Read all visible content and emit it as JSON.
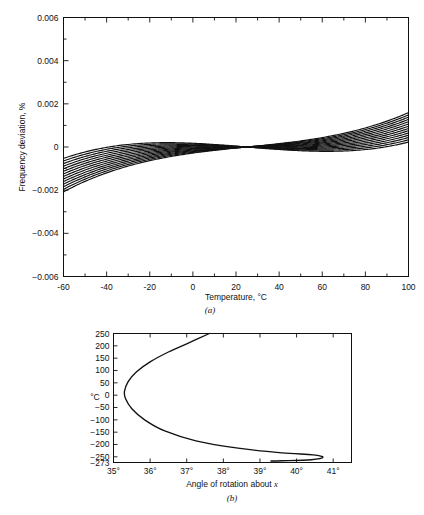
{
  "figure": {
    "panels": [
      {
        "id": "a",
        "caption": "(a)",
        "xlabel": "Temperature, °C",
        "ylabel": "Frequency deviation, %",
        "x_ticks": [
          "-60",
          "-40",
          "-20",
          "0",
          "20",
          "40",
          "60",
          "80",
          "100"
        ],
        "y_ticks": [
          "0.006",
          "0.004",
          "0.002",
          "0",
          "-0.002",
          "-0.004",
          "-0.006"
        ]
      },
      {
        "id": "b",
        "caption": "(b)",
        "xlabel_pre": "Angle of rotation about ",
        "xlabel_italic": "x",
        "ylabel": "°C",
        "x_ticks": [
          "35°",
          "36°",
          "37°",
          "38°",
          "39°",
          "40°",
          "41°"
        ],
        "y_ticks": [
          "250",
          "200",
          "150",
          "100",
          "50",
          "0",
          "-50",
          "-100",
          "-150",
          "-200",
          "-250",
          "-273"
        ]
      }
    ]
  },
  "chart_data": [
    {
      "type": "line",
      "panel": "a",
      "title": "",
      "xlabel": "Temperature, °C",
      "ylabel": "Frequency deviation, %",
      "xlim": [
        -60,
        100
      ],
      "ylim": [
        -0.006,
        0.006
      ],
      "xticks": [
        -60,
        -40,
        -20,
        0,
        20,
        40,
        60,
        80,
        100
      ],
      "yticks": [
        0.006,
        0.004,
        0.002,
        0,
        -0.002,
        -0.004,
        -0.006
      ],
      "minor_xticks": [
        -50,
        -30,
        -10,
        10,
        30,
        50,
        70,
        90
      ],
      "minor_yticks": [
        0.005,
        0.003,
        0.001,
        -0.001,
        -0.003,
        -0.005
      ],
      "grid": false,
      "legend": "none",
      "note": "Family of cubic frequency-deviation curves for AT-cut quartz crystals at a range of cut angles; all curves pass through an inflection point near 25 °C, 0 %.",
      "inflection_point": {
        "x": 25,
        "y": 0
      },
      "series": [
        {
          "name": "curve-1",
          "cubic_slope": 1.0,
          "x": [
            -60,
            -40,
            -20,
            0,
            20,
            25,
            30,
            50,
            70,
            90,
            100
          ],
          "values": [
            -0.00535,
            -0.00252,
            -0.00069,
            0.0,
            0.00016,
            0.0,
            -0.0002,
            -0.001,
            -0.00106,
            0.00084,
            0.0029
          ]
        },
        {
          "name": "curve-2",
          "cubic_slope": 0.86,
          "x": [
            -60,
            -40,
            -20,
            0,
            20,
            25,
            30,
            50,
            70,
            90,
            100
          ],
          "values": [
            -0.00452,
            -0.0019,
            -0.00038,
            0.00014,
            0.00015,
            0.0,
            -0.00016,
            -0.00073,
            -0.00058,
            0.0015,
            0.0036
          ]
        },
        {
          "name": "curve-3",
          "cubic_slope": 0.72,
          "x": [
            -60,
            -40,
            -20,
            0,
            20,
            25,
            30,
            50,
            70,
            90,
            100
          ],
          "values": [
            -0.0037,
            -0.00128,
            -7e-05,
            0.00028,
            0.00013,
            0.0,
            -0.00012,
            -0.00046,
            -0.0001,
            0.00216,
            0.0043
          ]
        },
        {
          "name": "curve-4",
          "cubic_slope": 0.58,
          "x": [
            -60,
            -40,
            -20,
            0,
            20,
            25,
            30,
            50,
            70,
            90,
            100
          ],
          "values": [
            -0.00288,
            -0.00066,
            0.00024,
            0.00042,
            0.00011,
            0.0,
            -8e-05,
            -0.00019,
            0.00038,
            0.00282,
            0.005
          ]
        },
        {
          "name": "curve-5",
          "cubic_slope": 0.44,
          "x": [
            -60,
            -40,
            -20,
            0,
            20,
            25,
            30,
            50,
            70,
            90,
            100
          ],
          "values": [
            -0.00205,
            -4e-05,
            0.00055,
            0.00056,
            0.0001,
            0.0,
            -4e-05,
            8e-05,
            0.00086,
            0.00348,
            0.0057
          ]
        },
        {
          "name": "curve-6",
          "cubic_slope": 0.3,
          "x": [
            -60,
            -40,
            -20,
            0,
            20,
            25,
            30,
            50,
            70,
            90,
            100
          ],
          "values": [
            -0.00123,
            0.00058,
            0.00086,
            0.0007,
            8e-05,
            0.0,
            0.0,
            0.00035,
            0.00134,
            0.00414,
            0.006
          ]
        },
        {
          "name": "curve-7",
          "cubic_slope": 0.16,
          "x": [
            -60,
            -40,
            -20,
            0,
            20,
            25,
            30,
            50,
            70,
            90,
            100
          ],
          "values": [
            -0.00041,
            0.0012,
            0.00117,
            0.00084,
            7e-05,
            0.0,
            4e-05,
            0.00062,
            0.00182,
            0.0048,
            0.006
          ]
        },
        {
          "name": "curve-8",
          "cubic_slope": 0.02,
          "x": [
            -60,
            -40,
            -20,
            0,
            20,
            25,
            30,
            50,
            70,
            90,
            100
          ],
          "values": [
            0.00042,
            0.00182,
            0.00148,
            0.00098,
            5e-05,
            0.0,
            8e-05,
            0.00089,
            0.0023,
            0.00546,
            0.006
          ]
        },
        {
          "name": "curve-9",
          "cubic_slope": -0.12,
          "x": [
            -60,
            -40,
            -20,
            0,
            20,
            25,
            30,
            50,
            70,
            90,
            100
          ],
          "values": [
            0.00124,
            0.00244,
            0.00179,
            0.00112,
            4e-05,
            0.0,
            0.00012,
            0.00116,
            0.00278,
            0.006,
            0.006
          ]
        },
        {
          "name": "curve-10",
          "cubic_slope": -0.26,
          "x": [
            -60,
            -40,
            -20,
            0,
            20,
            25,
            30,
            50,
            70,
            90,
            100
          ],
          "values": [
            0.00207,
            0.00306,
            0.0021,
            0.00126,
            2e-05,
            0.0,
            0.00016,
            0.00143,
            0.00326,
            0.006,
            0.006
          ]
        },
        {
          "name": "curve-11",
          "cubic_slope": -0.4,
          "x": [
            -60,
            -40,
            -20,
            0,
            20,
            25,
            30,
            50,
            70,
            90,
            100
          ],
          "values": [
            0.00289,
            0.00368,
            0.00241,
            0.0014,
            1e-05,
            0.0,
            0.0002,
            0.0017,
            0.00374,
            0.006,
            0.006
          ]
        },
        {
          "name": "curve-12",
          "cubic_slope": -0.54,
          "x": [
            -60,
            -40,
            -20,
            0,
            20,
            25,
            30,
            50,
            70,
            90,
            100
          ],
          "values": [
            0.00372,
            0.0043,
            0.00272,
            0.00154,
            0.0,
            0.0,
            0.00024,
            0.00197,
            0.00422,
            0.006,
            0.006
          ]
        },
        {
          "name": "curve-13",
          "cubic_slope": -0.68,
          "x": [
            -60,
            -40,
            -20,
            0,
            20,
            25,
            30,
            50,
            70,
            90,
            100
          ],
          "values": [
            0.00454,
            0.00492,
            0.00303,
            0.00168,
            -2e-05,
            0.0,
            0.00028,
            0.00224,
            0.0047,
            0.006,
            0.006
          ]
        },
        {
          "name": "curve-14",
          "cubic_slope": -0.82,
          "x": [
            -60,
            -40,
            -20,
            0,
            20,
            25,
            30,
            50,
            70,
            90,
            100
          ],
          "values": [
            0.0052,
            0.00545,
            0.0033,
            0.0018,
            -3e-05,
            0.0,
            0.00032,
            0.00248,
            0.0051,
            0.006,
            0.006
          ]
        }
      ]
    },
    {
      "type": "line",
      "panel": "b",
      "title": "",
      "xlabel": "Angle of rotation about x",
      "ylabel": "°C",
      "xlim": [
        35,
        41.5
      ],
      "ylim": [
        -273,
        250
      ],
      "xticks": [
        35,
        36,
        37,
        38,
        39,
        40,
        41
      ],
      "yticks": [
        250,
        200,
        150,
        100,
        50,
        0,
        -50,
        -100,
        -150,
        -200,
        -250,
        -273
      ],
      "grid": false,
      "legend": "none",
      "note": "Locus of turning-point temperature versus AT-cut angle of rotation about x; curve is parametric (double-valued in temperature).",
      "curve_points": [
        {
          "angle": 37.62,
          "temp": 250
        },
        {
          "angle": 37.1,
          "temp": 215
        },
        {
          "angle": 36.5,
          "temp": 175
        },
        {
          "angle": 36.0,
          "temp": 135
        },
        {
          "angle": 35.63,
          "temp": 95
        },
        {
          "angle": 35.4,
          "temp": 55
        },
        {
          "angle": 35.3,
          "temp": 15
        },
        {
          "angle": 35.33,
          "temp": -15
        },
        {
          "angle": 35.5,
          "temp": -55
        },
        {
          "angle": 35.85,
          "temp": -100
        },
        {
          "angle": 36.4,
          "temp": -145
        },
        {
          "angle": 37.25,
          "temp": -185
        },
        {
          "angle": 38.4,
          "temp": -215
        },
        {
          "angle": 39.6,
          "temp": -234
        },
        {
          "angle": 40.45,
          "temp": -242
        },
        {
          "angle": 40.72,
          "temp": -252
        },
        {
          "angle": 40.4,
          "temp": -262
        },
        {
          "angle": 39.6,
          "temp": -266
        },
        {
          "angle": 39.3,
          "temp": -267
        }
      ]
    }
  ]
}
